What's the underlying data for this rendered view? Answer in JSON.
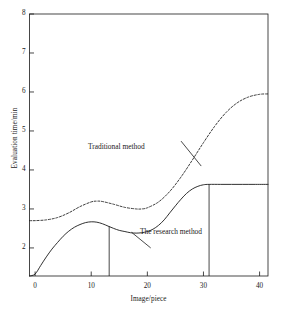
{
  "figure": {
    "name": "evaluation-time-line-chart",
    "background": "#ffffff",
    "line_color": "#1a1a1a"
  },
  "axes": {
    "x_title": "Image/piece",
    "y_title": "Evaluation time/min",
    "x_ticks": [
      "0",
      "10",
      "20",
      "30",
      "40"
    ],
    "y_ticks": [
      "2",
      "3",
      "4",
      "5",
      "6",
      "7",
      "8"
    ]
  },
  "annotations": {
    "traditional": "Traditional method",
    "research": "The research method"
  },
  "chart_data": {
    "type": "line",
    "title": "",
    "xlabel": "Image/piece",
    "ylabel": "Evaluation time/min",
    "xlim": [
      -1,
      41.5
    ],
    "ylim": [
      1.28,
      8
    ],
    "xticks": [
      0,
      10,
      20,
      30,
      40
    ],
    "yticks": [
      2,
      3,
      4,
      5,
      6,
      7,
      8
    ],
    "grid": false,
    "legend": "inline-annotations",
    "series": [
      {
        "name": "Traditional method",
        "style": "dashed",
        "color": "#1a1a1a",
        "x": [
          -1,
          0,
          2,
          4,
          6,
          8,
          10,
          11,
          12,
          14,
          16,
          18,
          19,
          20,
          22,
          24,
          26,
          28,
          30,
          32,
          34,
          36,
          38,
          40,
          41.5
        ],
        "y": [
          2.7,
          2.7,
          2.72,
          2.78,
          2.9,
          3.06,
          3.18,
          3.2,
          3.19,
          3.12,
          3.04,
          3.0,
          3.0,
          3.03,
          3.18,
          3.45,
          3.82,
          4.25,
          4.7,
          5.12,
          5.47,
          5.72,
          5.87,
          5.94,
          5.95
        ]
      },
      {
        "name": "The research method",
        "style": "solid",
        "color": "#1a1a1a",
        "x": [
          -1,
          0,
          1,
          2,
          3,
          4,
          5,
          6,
          7,
          8,
          9,
          10,
          11,
          12,
          13,
          14,
          15,
          16,
          17,
          18,
          19,
          20,
          21,
          22,
          23,
          24,
          25,
          26,
          27,
          28,
          29,
          30,
          31,
          33,
          35,
          37,
          39,
          41.5
        ],
        "y": [
          1.28,
          1.33,
          1.55,
          1.77,
          1.97,
          2.14,
          2.3,
          2.43,
          2.53,
          2.6,
          2.65,
          2.67,
          2.66,
          2.62,
          2.56,
          2.5,
          2.45,
          2.42,
          2.39,
          2.38,
          2.39,
          2.42,
          2.48,
          2.58,
          2.72,
          2.9,
          3.08,
          3.25,
          3.4,
          3.51,
          3.58,
          3.62,
          3.63,
          3.63,
          3.63,
          3.63,
          3.63,
          3.63
        ]
      }
    ],
    "droplines": [
      {
        "name": "dropline-left",
        "x": 13.2,
        "y_top": 2.555,
        "y_bottom": 1.28
      },
      {
        "name": "dropline-right",
        "x": 31.0,
        "y_top": 3.63,
        "y_bottom": 1.28
      }
    ],
    "leader_lines": [
      {
        "name": "leader-traditional",
        "x1": 26.0,
        "y1": 4.74,
        "x2": 29.6,
        "y2": 4.1
      },
      {
        "name": "leader-research",
        "x1": 17.2,
        "y1": 2.4,
        "x2": 20.6,
        "y2": 2.0
      }
    ]
  }
}
